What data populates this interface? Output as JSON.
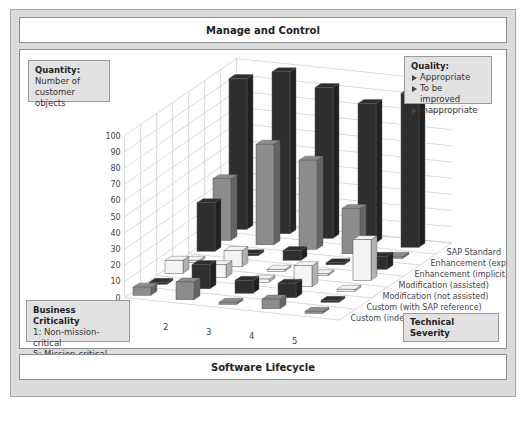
{
  "header": {
    "title": "Manage and Control"
  },
  "footer": {
    "title": "Software Lifecycle"
  },
  "quantity_box": {
    "heading": "Quantity:",
    "line1": "Number of",
    "line2": "customer objects"
  },
  "quality_box": {
    "heading": "Quality:",
    "items": [
      "Appropriate",
      "To be improved",
      "Inappropriate"
    ]
  },
  "criticality_box": {
    "heading": "Business Criticality",
    "line1": "1:  Non-mission-critical",
    "line2": "5:  Mission-critical"
  },
  "severity_box": {
    "label": "Technical Severity"
  },
  "colors": {
    "dark": "#2e2e2e",
    "mid": "#8c8c8c",
    "light": "#f4f4f4",
    "frame": "#dcdcdc",
    "box": "#e2e2e2"
  },
  "chart_data": {
    "type": "bar3d",
    "title": "",
    "xlabel": "Business Criticality",
    "ylabel": "Number of customer objects",
    "zlabel": "Technical Severity",
    "ylim": [
      0,
      100
    ],
    "yticks": [
      0,
      10,
      20,
      30,
      40,
      50,
      60,
      70,
      80,
      90,
      100
    ],
    "categories": [
      "1",
      "2",
      "3",
      "4",
      "5"
    ],
    "series": [
      {
        "name": "Custom (independant)",
        "quality": "To be improved",
        "color": "#8c8c8c",
        "values": [
          5,
          11,
          1,
          6,
          1
        ]
      },
      {
        "name": "Custom (with SAP reference)",
        "quality": "Inappropriate",
        "color": "#2e2e2e",
        "values": [
          1,
          15,
          8,
          9,
          1
        ]
      },
      {
        "name": "Modification (not assisted)",
        "quality": "Appropriate",
        "color": "#f4f4f4",
        "values": [
          8,
          8,
          2,
          13,
          1
        ]
      },
      {
        "name": "Modification (assisted)",
        "quality": "Appropriate",
        "color": "#f4f4f4",
        "values": [
          1,
          10,
          1,
          0,
          25
        ]
      },
      {
        "name": "Enhancement (implicit)",
        "quality": "Inappropriate",
        "color": "#2e2e2e",
        "values": [
          30,
          1,
          6,
          1,
          8
        ]
      },
      {
        "name": "Enhancement (explicit)",
        "quality": "To be improved",
        "color": "#8c8c8c",
        "values": [
          38,
          62,
          55,
          28,
          1
        ]
      },
      {
        "name": "SAP Standard",
        "quality": "Inappropriate",
        "color": "#2e2e2e",
        "values": [
          93,
          100,
          93,
          86,
          95
        ]
      }
    ],
    "grid": true
  }
}
